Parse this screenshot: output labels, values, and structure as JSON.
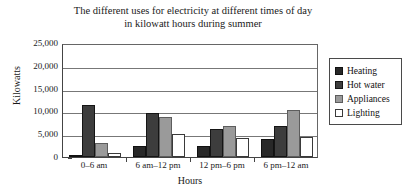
{
  "chart_data": {
    "type": "bar",
    "title": "The different uses for electricity at different times of day in kilowatt hours during summer",
    "title_lines": [
      "The different uses for electricity at different times of day",
      "in kilowatt hours during summer"
    ],
    "xlabel": "Hours",
    "ylabel": "Kilowatts",
    "ylim": [
      0,
      25000
    ],
    "ytick_labels": [
      "25,000",
      "20,000",
      "15,000",
      "10,000",
      "5,000",
      "0"
    ],
    "ytick_values": [
      25000,
      20000,
      15000,
      10000,
      5000,
      0
    ],
    "grid": true,
    "legend_position": "right",
    "categories": [
      "0–6 am",
      "6 am–12 pm",
      "12 pm–6 pm",
      "6 pm–12 am"
    ],
    "series": [
      {
        "name": "Heating",
        "color": "#282828",
        "values": [
          200,
          2500,
          2500,
          4000
        ]
      },
      {
        "name": "Hot water",
        "color": "#3d3d3d",
        "values": [
          11500,
          9700,
          6200,
          6800
        ]
      },
      {
        "name": "Appliances",
        "color": "#9a9a9a",
        "values": [
          3000,
          8700,
          6800,
          10300
        ]
      },
      {
        "name": "Lighting",
        "color": "#ffffff",
        "values": [
          800,
          5000,
          4100,
          4300
        ]
      }
    ]
  }
}
